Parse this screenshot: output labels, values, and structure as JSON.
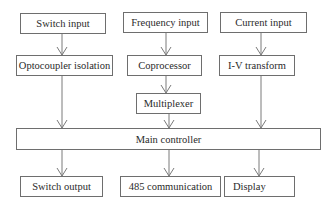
{
  "diagram": {
    "nodes": {
      "switch_input": "Switch input",
      "frequency_input": "Frequency input",
      "current_input": "Current input",
      "optocoupler_isolation": "Optocoupler isolation",
      "coprocessor": "Coprocessor",
      "iv_transform": "I-V transform",
      "multiplexer": "Multiplexer",
      "main_controller": "Main controller",
      "switch_output": "Switch output",
      "communication_485": "485 communication",
      "display": "Display"
    },
    "edges": [
      [
        "switch_input",
        "optocoupler_isolation"
      ],
      [
        "frequency_input",
        "coprocessor"
      ],
      [
        "current_input",
        "iv_transform"
      ],
      [
        "coprocessor",
        "multiplexer"
      ],
      [
        "optocoupler_isolation",
        "main_controller"
      ],
      [
        "multiplexer",
        "main_controller"
      ],
      [
        "iv_transform",
        "main_controller"
      ],
      [
        "main_controller",
        "switch_output"
      ],
      [
        "main_controller",
        "communication_485"
      ],
      [
        "main_controller",
        "display"
      ]
    ],
    "colors": {
      "line": "#7a7a7a",
      "border": "#6e6e6e",
      "text": "#2a2a2a"
    }
  }
}
